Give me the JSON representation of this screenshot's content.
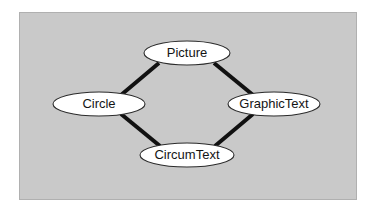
{
  "diagram": {
    "type": "class-hierarchy-graph",
    "title": "",
    "panel": {
      "background_color": "#c9c9c9",
      "border_color": "#b0b0b0"
    },
    "style": {
      "node_fill": "#ffffff",
      "node_stroke": "#2a2a2a",
      "edge_color": "#111111",
      "label_color": "#141414"
    },
    "nodes": [
      {
        "id": "picture",
        "label": "Picture",
        "cx": 187,
        "cy": 53,
        "rx": 43,
        "ry": 12
      },
      {
        "id": "circle",
        "label": "Circle",
        "cx": 99,
        "cy": 104,
        "rx": 46,
        "ry": 12
      },
      {
        "id": "graphictext",
        "label": "GraphicText",
        "cx": 274,
        "cy": 104,
        "rx": 46,
        "ry": 12
      },
      {
        "id": "circumtext",
        "label": "CircumText",
        "cx": 187,
        "cy": 155,
        "rx": 47,
        "ry": 12
      }
    ],
    "edges": [
      {
        "id": "picture-circle",
        "from": "picture",
        "to": "circle",
        "x1": 159,
        "y1": 63,
        "x2": 121,
        "y2": 95
      },
      {
        "id": "picture-graphictext",
        "from": "picture",
        "to": "graphictext",
        "x1": 214,
        "y1": 63,
        "x2": 253,
        "y2": 95
      },
      {
        "id": "circle-circumtext",
        "from": "circle",
        "to": "circumtext",
        "x1": 121,
        "y1": 114,
        "x2": 160,
        "y2": 146
      },
      {
        "id": "graphictext-circumtext",
        "from": "graphictext",
        "to": "circumtext",
        "x1": 253,
        "y1": 114,
        "x2": 215,
        "y2": 146
      }
    ]
  }
}
